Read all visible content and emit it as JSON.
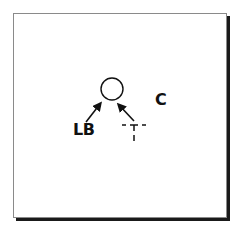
{
  "diagram": {
    "type": "football-play-diagram",
    "labels": {
      "linebacker": "LB",
      "center": "C"
    },
    "symbols": {
      "offensive_player": "circle",
      "target_marker": "T-marker (dashed)"
    },
    "arrows": [
      {
        "from": "LB",
        "to": "circle"
      },
      {
        "from": "T-marker",
        "to": "circle"
      }
    ],
    "colors": {
      "ink": "#111111",
      "frame": "#8a8a8a",
      "shadow": "#1a1a1a",
      "background": "#ffffff"
    }
  }
}
